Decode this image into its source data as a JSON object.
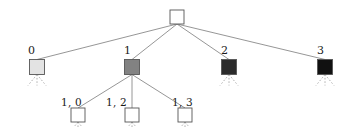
{
  "figure": {
    "type": "tree-diagram",
    "width": 358,
    "height": 127,
    "background": "#ffffff",
    "edge_color": "#8a8a8a",
    "dashed_edge_color": "#a8a8a8",
    "node_stroke": "#555555"
  },
  "nodes": {
    "root": {
      "label": "",
      "x": 177,
      "y": 17,
      "size": 14,
      "fill": "#ffffff"
    },
    "level1": [
      {
        "label": "0",
        "x": 37,
        "y": 67,
        "size": 15,
        "fill": "#e3e3e3",
        "label_x": 28,
        "label_y": 45,
        "expandable": true
      },
      {
        "label": "1",
        "x": 132,
        "y": 67,
        "size": 15,
        "fill": "#828282",
        "label_x": 124,
        "label_y": 45,
        "expandable": false
      },
      {
        "label": "2",
        "x": 229,
        "y": 67,
        "size": 15,
        "fill": "#2b2b2b",
        "label_x": 221,
        "label_y": 45,
        "expandable": true
      },
      {
        "label": "3",
        "x": 325,
        "y": 67,
        "size": 15,
        "fill": "#111111",
        "label_x": 317,
        "label_y": 45,
        "expandable": true
      }
    ],
    "level2": [
      {
        "label": "1, 0",
        "x": 78,
        "y": 115,
        "size": 14,
        "fill": "#ffffff",
        "label_x": 61,
        "label_y": 97
      },
      {
        "label": "1, 2",
        "x": 132,
        "y": 115,
        "size": 14,
        "fill": "#ffffff",
        "label_x": 106,
        "label_y": 97
      },
      {
        "label": "1, 3",
        "x": 185,
        "y": 115,
        "size": 14,
        "fill": "#ffffff",
        "label_x": 172,
        "label_y": 97
      }
    ]
  },
  "edges": {
    "solid": [
      {
        "from": "root",
        "to": "0"
      },
      {
        "from": "root",
        "to": "1"
      },
      {
        "from": "root",
        "to": "2"
      },
      {
        "from": "root",
        "to": "3"
      },
      {
        "from": "1",
        "to": "1, 0"
      },
      {
        "from": "1",
        "to": "1, 2"
      },
      {
        "from": "1",
        "to": "1, 3"
      }
    ],
    "dashed_fanouts": [
      {
        "parent": "0",
        "count": 3
      },
      {
        "parent": "2",
        "count": 3
      },
      {
        "parent": "3",
        "count": 3
      },
      {
        "parent": "1, 0",
        "count": 3
      },
      {
        "parent": "1, 2",
        "count": 3
      },
      {
        "parent": "1, 3",
        "count": 3
      }
    ]
  }
}
